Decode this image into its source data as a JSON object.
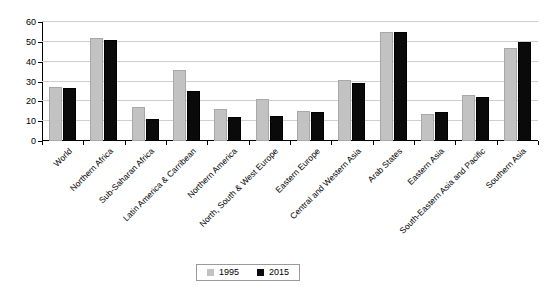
{
  "chart_data": {
    "type": "bar",
    "title": "",
    "subtitle": "",
    "xlabel": "",
    "ylabel": "",
    "ylim": [
      0,
      60
    ],
    "yticks": [
      0,
      10,
      20,
      30,
      40,
      50,
      60
    ],
    "grid": true,
    "legend_position": "bottom-center",
    "categories": [
      "World",
      "Northern Africa",
      "Sub-Saharan Africa",
      "Latin America & Carribean",
      "Northern America",
      "North, South & West Europe",
      "Eastern Europe",
      "Central and Western Asia",
      "Arab States",
      "Eastern Asia",
      "South-Eastern Asia and Pacific",
      "Southern Asia"
    ],
    "series": [
      {
        "name": "1995",
        "color": "#c2c2c2",
        "values": [
          27,
          52,
          17,
          36,
          16,
          21,
          15,
          31,
          55,
          13.5,
          23,
          47
        ]
      },
      {
        "name": "2015",
        "color": "#0a0a0a",
        "values": [
          26.5,
          51,
          11,
          25,
          12,
          12.5,
          14.5,
          29,
          55,
          14.5,
          22,
          50
        ]
      }
    ]
  },
  "legend": {
    "entries": [
      {
        "label": "1995"
      },
      {
        "label": "2015"
      }
    ]
  },
  "caption": {
    "fragment": ""
  }
}
